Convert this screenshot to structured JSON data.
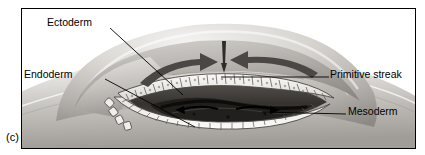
{
  "figure": {
    "part_marker": "(c)",
    "frame_color": "#000000",
    "background_color": "#ffffff"
  },
  "labels": [
    {
      "id": "ectoderm",
      "text": "Ectoderm",
      "side": "left"
    },
    {
      "id": "endoderm",
      "text": "Endoderm",
      "side": "left"
    },
    {
      "id": "primitive-streak",
      "text": "Primitive streak",
      "side": "right"
    },
    {
      "id": "mesoderm",
      "text": "Mesoderm",
      "side": "right"
    }
  ],
  "illustration": {
    "subject": "gastrulating embryo with cut-away wedge",
    "arrows": [
      {
        "name": "left-migration-arrow",
        "direction": "rightward-curving"
      },
      {
        "name": "right-migration-arrow",
        "direction": "leftward-curving"
      },
      {
        "name": "streak-ingression-arrow",
        "direction": "downward"
      }
    ],
    "tissue_tones": {
      "dome_highlight": "#ebe9e6",
      "dome_midtone": "#bdbab6",
      "dome_shadow": "#8e8b87",
      "cell_layer": "#f2f1ee",
      "cavity_dark": "#3b3835",
      "mesoderm_dark": "#1d1b19"
    }
  }
}
